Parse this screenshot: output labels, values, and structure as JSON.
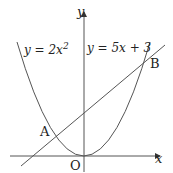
{
  "diagram": {
    "axes": {
      "x_label": "x",
      "y_label": "y",
      "origin_label": "O"
    },
    "curves": [
      {
        "name": "parabola",
        "equation_lhs": "y = 2x",
        "exponent": "2"
      },
      {
        "name": "line",
        "equation": "y = 5x + 3"
      }
    ],
    "points": [
      {
        "label": "A"
      },
      {
        "label": "B"
      }
    ]
  }
}
